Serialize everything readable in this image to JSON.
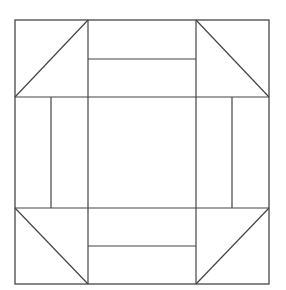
{
  "diagram": {
    "type": "quilt-block",
    "colors": {
      "background": "#ffffff",
      "line": "#444444",
      "border": "#555555"
    },
    "outer": {
      "x1": 15,
      "y1": 20,
      "x2": 269,
      "y2": 284
    },
    "grid": {
      "verticals": [
        88,
        196
      ],
      "horizontals": [
        97,
        208
      ]
    },
    "side_units": {
      "top_bar_y": 59,
      "bottom_bar_y": 246,
      "left_bar_x": 51,
      "right_bar_x": 232
    },
    "corner_diagonals": [
      {
        "name": "top-left",
        "x1": 15,
        "y1": 97,
        "x2": 88,
        "y2": 20
      },
      {
        "name": "top-right",
        "x1": 196,
        "y1": 20,
        "x2": 269,
        "y2": 97
      },
      {
        "name": "bottom-left",
        "x1": 15,
        "y1": 208,
        "x2": 88,
        "y2": 284
      },
      {
        "name": "bottom-right",
        "x1": 196,
        "y1": 284,
        "x2": 269,
        "y2": 208
      }
    ]
  }
}
